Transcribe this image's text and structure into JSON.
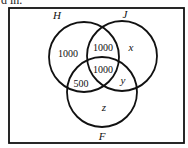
{
  "top_text": "d in.",
  "diagram": {
    "type": "venn-3",
    "sets": [
      {
        "name": "H",
        "cx": 84,
        "cy": 57,
        "r": 35
      },
      {
        "name": "J",
        "cx": 122,
        "cy": 56,
        "r": 35
      },
      {
        "name": "F",
        "cx": 102,
        "cy": 92,
        "r": 35
      }
    ],
    "regions": {
      "h_only": "1000",
      "h_and_j_only": "1000",
      "h_j_f": "1000",
      "j_only": "x",
      "h_and_f_only": "500",
      "j_and_f_only": "y",
      "f_only": "z"
    },
    "set_labels": {
      "h": "H",
      "j": "J",
      "f": "F"
    },
    "colors": {
      "stroke": "#111111",
      "background": "#ffffff"
    }
  }
}
